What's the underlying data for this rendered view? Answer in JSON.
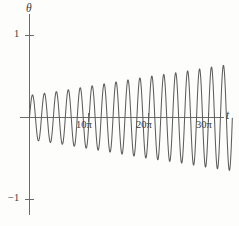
{
  "figure": {
    "width": 239,
    "height": 226,
    "background_color": "#fdfdfc",
    "curve_color": "#5d5d5d",
    "axis_color": "#6b6b6b",
    "text_color": "#3a3a3a"
  },
  "labels": {
    "y_axis_name": "θ",
    "x_axis_name": "t",
    "y_tick_pos": "1",
    "y_tick_neg": "−1",
    "x_tick_1": "10π",
    "x_tick_2": "20π",
    "x_tick_3": "30π"
  },
  "chart_data": {
    "type": "line",
    "title": "",
    "subtitle": "",
    "xlabel": "t",
    "ylabel": "θ",
    "grid": false,
    "legend": null,
    "xlim": [
      -2.5,
      35.5
    ],
    "ylim": [
      -1.12,
      1.12
    ],
    "x_units": "pi",
    "x_ticks": [
      10,
      20,
      30
    ],
    "x_tick_labels": [
      "10π",
      "20π",
      "30π"
    ],
    "y_ticks": [
      1,
      -1
    ],
    "y_tick_labels": [
      "1",
      "−1"
    ],
    "axis_origin": {
      "x": 0,
      "y": 0
    },
    "series": [
      {
        "name": "theta(t)",
        "color": "#5d5d5d",
        "formula_note": "amplitude envelope A(t) = 0.265 + 0.0115 * (t/pi), oscillation period 2*pi",
        "envelope": {
          "x": [
            0,
            5,
            10,
            15,
            20,
            25,
            30,
            34
          ],
          "upper": [
            0.27,
            0.32,
            0.38,
            0.44,
            0.5,
            0.55,
            0.61,
            0.65
          ],
          "lower": [
            -0.27,
            -0.32,
            -0.38,
            -0.44,
            -0.5,
            -0.55,
            -0.61,
            -0.65
          ]
        },
        "peaks_x_over_pi": [
          0.5,
          2.5,
          4.5,
          6.5,
          8.5,
          10.5,
          12.5,
          14.5,
          16.5,
          18.5,
          20.5,
          22.5,
          24.5,
          26.5,
          28.5,
          30.5,
          32.5
        ],
        "peaks_y": [
          0.275,
          0.298,
          0.321,
          0.344,
          0.367,
          0.39,
          0.413,
          0.436,
          0.459,
          0.482,
          0.505,
          0.528,
          0.551,
          0.574,
          0.597,
          0.62,
          0.643
        ],
        "troughs_x_over_pi": [
          1.5,
          3.5,
          5.5,
          7.5,
          9.5,
          11.5,
          13.5,
          15.5,
          17.5,
          19.5,
          21.5,
          23.5,
          25.5,
          27.5,
          29.5,
          31.5,
          33.5
        ],
        "troughs_y": [
          -0.287,
          -0.31,
          -0.333,
          -0.356,
          -0.379,
          -0.402,
          -0.425,
          -0.448,
          -0.471,
          -0.494,
          -0.517,
          -0.54,
          -0.563,
          -0.586,
          -0.609,
          -0.632,
          -0.655
        ],
        "start_x_over_pi": 0,
        "end_x_over_pi": 34,
        "end_y": -0.66,
        "zero_crossings_count": 35,
        "cycles_visible": 17
      }
    ]
  }
}
